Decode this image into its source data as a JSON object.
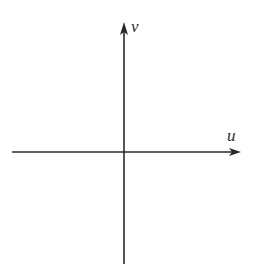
{
  "diagram": {
    "type": "coordinate-axes",
    "origin": {
      "x": 124,
      "y": 152
    },
    "horizontal_axis": {
      "label": "u",
      "x_start": 12,
      "x_end": 241,
      "y": 152,
      "arrow": "right"
    },
    "vertical_axis": {
      "label": "v",
      "y_start": 264,
      "y_end": 22,
      "x": 124,
      "arrow": "up"
    },
    "colors": {
      "axis": "#2a2a2a",
      "background": "#ffffff"
    }
  }
}
